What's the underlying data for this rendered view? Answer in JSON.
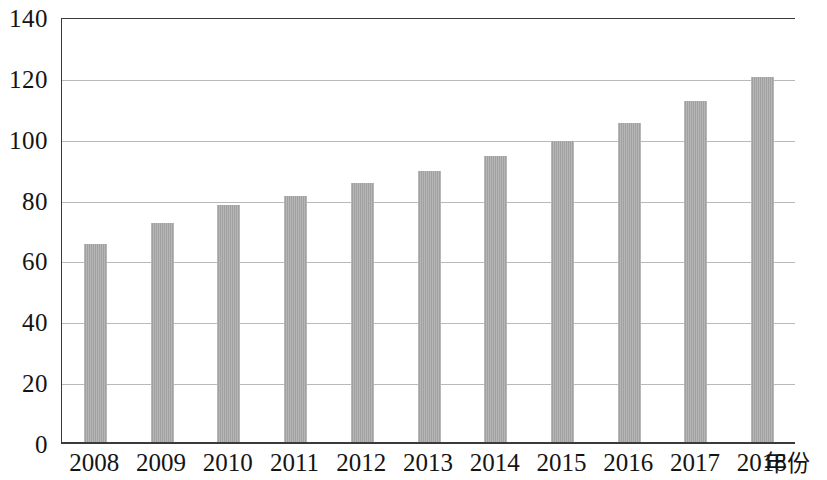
{
  "chart_data": {
    "type": "bar",
    "title": "",
    "subtitle": "",
    "xlabel": "年份",
    "ylabel": "",
    "categories": [
      "2008",
      "2009",
      "2010",
      "2011",
      "2012",
      "2013",
      "2014",
      "2015",
      "2016",
      "2017",
      "2018"
    ],
    "values": [
      65,
      72,
      78,
      81,
      85,
      89,
      94,
      99,
      105,
      112,
      120
    ],
    "data_labels": [
      "65",
      "72",
      "78",
      "81",
      "85",
      "89",
      "94",
      "99",
      "105",
      "112",
      "120"
    ],
    "ylim": [
      0,
      140
    ],
    "y_ticks": [
      0,
      20,
      40,
      60,
      80,
      100,
      120,
      140
    ],
    "y_tick_labels": [
      "0",
      "20",
      "40",
      "60",
      "80",
      "100",
      "120",
      "140"
    ],
    "grid": true,
    "grid_axis": "y",
    "legend": false,
    "legend_position": "none",
    "series": [
      {
        "name": "",
        "values": [
          65,
          72,
          78,
          81,
          85,
          89,
          94,
          99,
          105,
          112,
          120
        ]
      }
    ],
    "colors": {
      "bar_fill": "#a9a9a9",
      "gridline": "#b9b9b9",
      "axis_line": "#3a3a3a",
      "text": "#141414",
      "background": "#ffffff"
    }
  }
}
